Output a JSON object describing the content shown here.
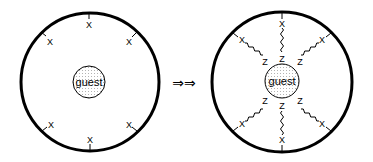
{
  "diagram": {
    "left_panel": {
      "description": "Host cavity with unbound guest",
      "guest_label": "guest",
      "site_marker": "X",
      "site_count": 6
    },
    "transition": {
      "arrow_glyph": "⇒⇒"
    },
    "right_panel": {
      "description": "Host cavity with guest bound via tethered linkers",
      "guest_label": "guest",
      "site_marker": "X",
      "linker_end_marker": "Z",
      "linker_count": 6
    }
  },
  "colors": {
    "stroke": "#000000",
    "guest_fill": "#ffffff",
    "guest_dots": "#9a9a9a",
    "background": "#ffffff"
  }
}
